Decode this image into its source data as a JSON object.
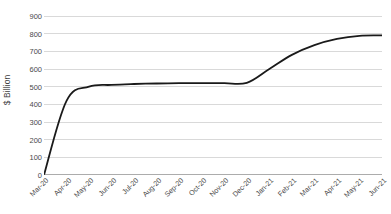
{
  "chart_data": {
    "type": "line",
    "title": "",
    "subtitle": "",
    "xlabel": "",
    "ylabel": "$ Billion",
    "ylim": [
      0,
      900
    ],
    "ytick_step": 100,
    "yticks": [
      0,
      100,
      200,
      300,
      400,
      500,
      600,
      700,
      800,
      900
    ],
    "ytick_labels": [
      "0",
      "100",
      "200",
      "300",
      "400",
      "500",
      "600",
      "700",
      "800",
      "900"
    ],
    "grid": "horizontal",
    "legend": "none",
    "categories": [
      "Mar-20",
      "Apr-20",
      "May-20",
      "Jun-20",
      "Jul-20",
      "Aug-20",
      "Sep-20",
      "Oct-20",
      "Nov-20",
      "Dec-20",
      "Jan-21",
      "Feb-21",
      "Mar-21",
      "Apr-21",
      "May-21",
      "Jun-21"
    ],
    "series": [
      {
        "name": "Cumulative total",
        "color": "#1a1a1a",
        "values": [
          0,
          420,
          500,
          510,
          515,
          518,
          520,
          520,
          520,
          522,
          600,
          680,
          735,
          770,
          788,
          790
        ]
      }
    ],
    "axis_line_color": "#595959",
    "grid_color": "#d9d9d9",
    "background": "#ffffff"
  }
}
